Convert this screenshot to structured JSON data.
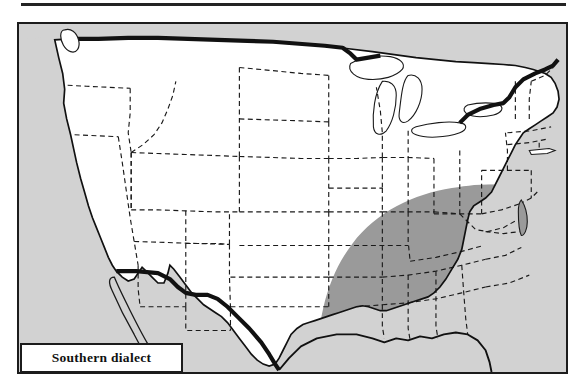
{
  "figure": {
    "kind": "thematic-map",
    "region": "United States",
    "title_rule_present": true
  },
  "legend": {
    "label": "Southern dialect",
    "swatch_meaning": "shaded area = Southern dialect region"
  },
  "colors": {
    "page_background": "#ffffff",
    "rule": "#232323",
    "frame_border": "#1c1c1c",
    "ocean_background": "#d2d2d2",
    "land_unshaded": "#ffffff",
    "dialect_region_shade": "#9a9a9a",
    "lakes": "#ffffff",
    "national_border": "#111111",
    "state_border": "#1a1a1a",
    "legend_background": "#ffffff",
    "legend_text": "#111111"
  },
  "map": {
    "outer_border_label": "national-boundary",
    "state_border_style": "dashed",
    "shaded_states": [
      "Virginia",
      "North Carolina",
      "South Carolina",
      "Georgia",
      "Florida",
      "Alabama",
      "Mississippi",
      "Louisiana",
      "Arkansas",
      "Tennessee",
      "eastern Texas"
    ],
    "unshaded_note": "remainder of contiguous United States",
    "neighbors_visible": [
      "Canada",
      "Mexico",
      "Baja California peninsula"
    ],
    "great_lakes": [
      "Lake Superior",
      "Lake Michigan",
      "Lake Huron",
      "Lake Erie",
      "Lake Ontario"
    ]
  }
}
